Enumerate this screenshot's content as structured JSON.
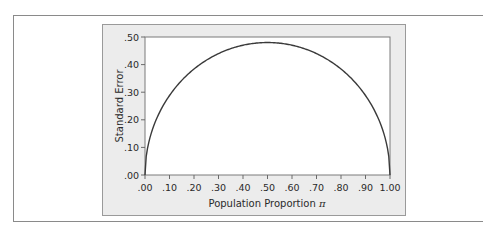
{
  "chart_data": {
    "type": "line",
    "title": "",
    "xlabel": "Population Proportion",
    "xlabel_symbol": "π",
    "ylabel": "Standard Error",
    "xlim": [
      0,
      1
    ],
    "ylim": [
      0,
      0.5
    ],
    "x_ticks": [
      ".00",
      ".10",
      ".20",
      ".30",
      ".40",
      ".50",
      ".60",
      ".70",
      ".80",
      ".90",
      "1.00"
    ],
    "y_ticks": [
      ".00",
      ".10",
      ".20",
      ".30",
      ".40",
      ".50"
    ],
    "grid": false,
    "legend": null,
    "series": [
      {
        "name": "Standard Error",
        "x": [
          0.0,
          0.01,
          0.05,
          0.1,
          0.15,
          0.2,
          0.25,
          0.3,
          0.35,
          0.4,
          0.45,
          0.5,
          0.55,
          0.6,
          0.65,
          0.7,
          0.75,
          0.8,
          0.85,
          0.9,
          0.95,
          0.99,
          1.0
        ],
        "values": [
          0.0,
          0.096,
          0.209,
          0.288,
          0.343,
          0.384,
          0.416,
          0.44,
          0.458,
          0.47,
          0.478,
          0.48,
          0.478,
          0.47,
          0.458,
          0.44,
          0.416,
          0.384,
          0.343,
          0.288,
          0.209,
          0.096,
          0.0
        ],
        "color": "#3a3a3a"
      }
    ]
  },
  "colors": {
    "panel_background": "#ececec",
    "plot_background": "#ffffff",
    "frame_border": "#8a8a8a",
    "curve": "#3a3a3a"
  }
}
